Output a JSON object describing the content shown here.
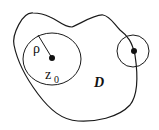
{
  "diagram": {
    "labels": {
      "radius": "ρ",
      "center": "z",
      "center_sub": "0",
      "domain": "D"
    },
    "colors": {
      "stroke": "#1a1a1a",
      "background": "#ffffff"
    }
  }
}
